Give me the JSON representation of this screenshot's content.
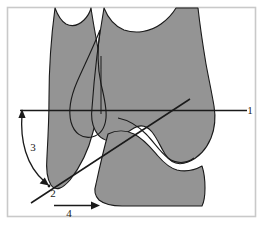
{
  "figure": {
    "background_color": "#ffffff",
    "frame_color": "#c9c9c9",
    "bone_fill_color": "#949494",
    "outline_color": "#1a1a1a",
    "line_color": "#1a1a1a",
    "labels": [
      {
        "id": "1",
        "text": "1",
        "meaning": "horizontal-reference-line",
        "x": 252,
        "y": 113
      },
      {
        "id": "2",
        "text": "2",
        "meaning": "vertex-point",
        "x": 53,
        "y": 196
      },
      {
        "id": "3",
        "text": "3",
        "meaning": "angle-arc",
        "x": 33,
        "y": 148
      },
      {
        "id": "4",
        "text": "4",
        "meaning": "horizontal-distance-arrow",
        "x": 68,
        "y": 214
      }
    ],
    "measurements": {
      "line_1_label": "1",
      "point_2_label": "2",
      "angle_3_label": "3",
      "distance_4_label": "4"
    },
    "frame": {
      "x": 7,
      "y": 7,
      "width": 249,
      "height": 210
    }
  }
}
